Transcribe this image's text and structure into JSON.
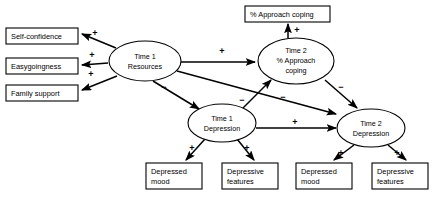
{
  "diagram": {
    "colors": {
      "background": "#ffffff",
      "stroke": "#000000",
      "node_fill": "#ffffff"
    },
    "boxes": [
      {
        "id": "self-confidence",
        "label": "Self-confidence",
        "x": 6,
        "y": 28,
        "w": 72,
        "h": 16,
        "lines": [
          "Self-confidence"
        ]
      },
      {
        "id": "easygoingness",
        "label": "Easygoingness",
        "x": 6,
        "y": 58,
        "w": 72,
        "h": 16,
        "lines": [
          "Easygoingness"
        ]
      },
      {
        "id": "family-support",
        "label": "Family support",
        "x": 6,
        "y": 85,
        "w": 72,
        "h": 16,
        "lines": [
          "Family support"
        ]
      },
      {
        "id": "approach-coping",
        "label": "% Approach coping",
        "x": 245,
        "y": 6,
        "w": 85,
        "h": 16,
        "lines": [
          "% Approach coping"
        ]
      },
      {
        "id": "t1-depressed-mood",
        "label": "Depressed mood",
        "x": 146,
        "y": 163,
        "w": 56,
        "h": 26,
        "lines": [
          "Depressed",
          "mood"
        ]
      },
      {
        "id": "t1-depressive-features",
        "label": "Depressive features",
        "x": 222,
        "y": 163,
        "w": 56,
        "h": 26,
        "lines": [
          "Depressive",
          "features"
        ]
      },
      {
        "id": "t2-depressed-mood",
        "label": "Depressed mood",
        "x": 296,
        "y": 163,
        "w": 56,
        "h": 26,
        "lines": [
          "Depressed",
          "mood"
        ]
      },
      {
        "id": "t2-depressive-features",
        "label": "Depressive features",
        "x": 372,
        "y": 163,
        "w": 56,
        "h": 26,
        "lines": [
          "Depressive",
          "features"
        ]
      }
    ],
    "ellipses": [
      {
        "id": "t1-resources",
        "label": "Time 1 Resources",
        "cx": 145,
        "cy": 61,
        "rx": 36,
        "ry": 20,
        "lines": [
          "Time 1",
          "Resources"
        ]
      },
      {
        "id": "t2-approach-coping",
        "label": "Time 2 % Approach coping",
        "cx": 296,
        "cy": 61,
        "rx": 38,
        "ry": 23,
        "lines": [
          "Time 2",
          "% Approach",
          "coping"
        ]
      },
      {
        "id": "t1-depression",
        "label": "Time 1 Depression",
        "cx": 222,
        "cy": 123,
        "rx": 34,
        "ry": 19,
        "lines": [
          "Time 1",
          "Depression"
        ]
      },
      {
        "id": "t2-depression",
        "label": "Time 2 Depression",
        "cx": 371,
        "cy": 128,
        "rx": 34,
        "ry": 19,
        "lines": [
          "Time 2",
          "Depression"
        ]
      }
    ],
    "edges": [
      {
        "id": "resources-to-self-confidence",
        "from": "t1-resources",
        "to": "self-confidence",
        "sign": "+",
        "sign_x": 95,
        "sign_y": 36
      },
      {
        "id": "resources-to-easygoingness",
        "from": "t1-resources",
        "to": "easygoingness",
        "sign": "+",
        "sign_x": 92,
        "sign_y": 58
      },
      {
        "id": "resources-to-family-support",
        "from": "t1-resources",
        "to": "family-support",
        "sign": "+",
        "sign_x": 91,
        "sign_y": 77
      },
      {
        "id": "resources-to-t2-coping",
        "from": "t1-resources",
        "to": "t2-approach-coping",
        "sign": "+",
        "sign_x": 222,
        "sign_y": 54
      },
      {
        "id": "resources-to-t1-depression",
        "from": "t1-resources",
        "to": "t1-depression",
        "sign": "−",
        "sign_x": 164,
        "sign_y": 90
      },
      {
        "id": "resources-to-t2-depression",
        "from": "t1-resources",
        "to": "t2-depression",
        "sign": "−",
        "sign_x": 283,
        "sign_y": 100
      },
      {
        "id": "t1-depression-to-t2-coping",
        "from": "t1-depression",
        "to": "t2-approach-coping",
        "sign": "−",
        "sign_x": 242,
        "sign_y": 103
      },
      {
        "id": "t1-depression-to-t2-depression",
        "from": "t1-depression",
        "to": "t2-depression",
        "sign": "+",
        "sign_x": 295,
        "sign_y": 119
      },
      {
        "id": "t2-coping-to-approach-coping",
        "from": "t2-approach-coping",
        "to": "approach-coping",
        "sign": "+",
        "sign_x": 297,
        "sign_y": 31
      },
      {
        "id": "t2-coping-to-t2-depression",
        "from": "t2-approach-coping",
        "to": "t2-depression",
        "sign": "−",
        "sign_x": 341,
        "sign_y": 90
      },
      {
        "id": "t1-depression-to-depressed-mood",
        "from": "t1-depression",
        "to": "t1-depressed-mood",
        "sign": "+",
        "sign_x": 192,
        "sign_y": 151
      },
      {
        "id": "t1-depression-to-depressive-features",
        "from": "t1-depression",
        "to": "t1-depressive-features",
        "sign": "+",
        "sign_x": 247,
        "sign_y": 151
      },
      {
        "id": "t2-depression-to-depressed-mood",
        "from": "t2-depression",
        "to": "t2-depressed-mood",
        "sign": "+",
        "sign_x": 341,
        "sign_y": 156
      },
      {
        "id": "t2-depression-to-depressive-features",
        "from": "t2-depression",
        "to": "t2-depressive-features",
        "sign": "+",
        "sign_x": 397,
        "sign_y": 156
      }
    ]
  }
}
